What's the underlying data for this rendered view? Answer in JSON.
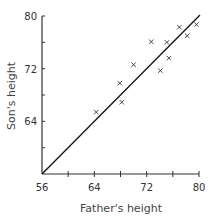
{
  "chart_data": {
    "type": "scatter",
    "title": "",
    "xlabel": "Father's height",
    "ylabel": "Son's height",
    "xlim": [
      56,
      80
    ],
    "ylim": [
      56,
      80
    ],
    "grid": false,
    "legend": null,
    "x_ticks": [
      56,
      60,
      64,
      68,
      72,
      76,
      80
    ],
    "y_ticks": [
      56,
      60,
      64,
      68,
      72,
      76,
      80
    ],
    "x_tick_labels": [
      "56",
      "64",
      "72",
      "80"
    ],
    "y_tick_labels": [
      "64",
      "72",
      "80"
    ],
    "marker": "x",
    "series": [
      {
        "name": "father-son pairs",
        "points": [
          {
            "x": 64.3,
            "y": 65.4
          },
          {
            "x": 67.9,
            "y": 69.8
          },
          {
            "x": 68.2,
            "y": 66.9
          },
          {
            "x": 70.0,
            "y": 72.6
          },
          {
            "x": 72.7,
            "y": 76.1
          },
          {
            "x": 74.1,
            "y": 71.7
          },
          {
            "x": 75.1,
            "y": 76.0
          },
          {
            "x": 75.4,
            "y": 73.6
          },
          {
            "x": 77.0,
            "y": 78.3
          },
          {
            "x": 78.2,
            "y": 77.0
          },
          {
            "x": 79.6,
            "y": 78.7
          }
        ]
      }
    ],
    "reference_line": {
      "name": "y = x",
      "from": [
        56,
        56
      ],
      "to": [
        80,
        80
      ]
    }
  },
  "colors": {
    "axis": "#333333",
    "marker": "#333333",
    "line": "#111111",
    "text": "#333333"
  }
}
